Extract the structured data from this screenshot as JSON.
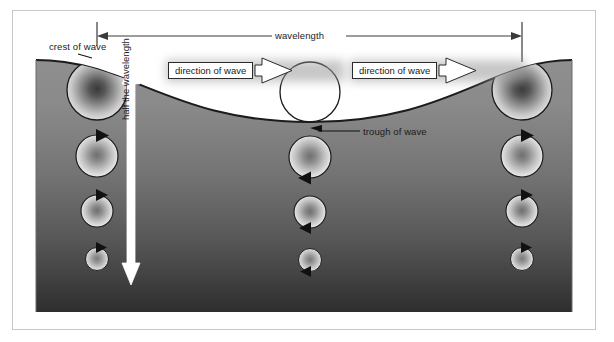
{
  "figure": {
    "kind": "physics-diagram",
    "labels": {
      "crest": "crest of wave",
      "trough": "trough of wave",
      "wavelength": "wavelength",
      "half_wavelength": "half the wavelength",
      "direction_left": "direction of wave",
      "direction_right": "direction of wave"
    },
    "colors": {
      "water_top": "#8d8d8d",
      "water_bottom": "#2f2f2f",
      "outline": "#1b1b1b",
      "frame": "#c9c9c9",
      "background": "#ffffff",
      "banner_fill": "#ffffff",
      "arrow_white": "#ffffff"
    },
    "geometry": {
      "frame": {
        "x": 12,
        "y": 10,
        "w": 584,
        "h": 320
      },
      "water": {
        "x": 36,
        "y": 50,
        "w": 536,
        "h": 262
      },
      "wave": {
        "crest_x": [
          97,
          522
        ],
        "trough_x": 310,
        "crest_y": 60,
        "trough_y": 122
      },
      "wavelength_line": {
        "x1": 97,
        "x2": 522,
        "y": 36
      },
      "half_wavelength_arrow": {
        "x": 131,
        "y1": 66,
        "y2": 281
      }
    },
    "orbit_columns": [
      {
        "name": "crest-column",
        "x": 97,
        "arrow_side": "top",
        "circles": [
          {
            "cy": 90,
            "r": 30,
            "fill": "dark-radial"
          },
          {
            "cy": 156,
            "r": 21,
            "fill": "light-radial"
          },
          {
            "cy": 211,
            "r": 16,
            "fill": "light-radial"
          },
          {
            "cy": 259,
            "r": 11,
            "fill": "light-radial"
          }
        ]
      },
      {
        "name": "trough-column",
        "x": 310,
        "arrow_side": "bottom",
        "circles": [
          {
            "cy": 92,
            "r": 30,
            "fill": "none-outline"
          },
          {
            "cy": 157,
            "r": 21,
            "fill": "light-radial"
          },
          {
            "cy": 212,
            "r": 16,
            "fill": "light-radial"
          },
          {
            "cy": 260,
            "r": 11,
            "fill": "light-radial"
          }
        ]
      },
      {
        "name": "second-crest-column",
        "x": 522,
        "arrow_side": "top",
        "circles": [
          {
            "cy": 90,
            "r": 30,
            "fill": "dark-radial"
          },
          {
            "cy": 156,
            "r": 21,
            "fill": "light-radial"
          },
          {
            "cy": 211,
            "r": 16,
            "fill": "light-radial"
          },
          {
            "cy": 259,
            "r": 11,
            "fill": "light-radial"
          }
        ]
      }
    ]
  }
}
